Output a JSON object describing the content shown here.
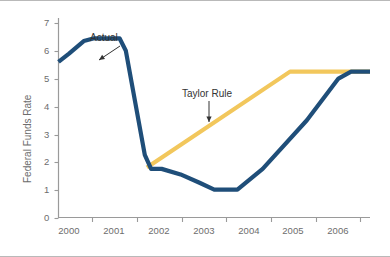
{
  "chart_data": {
    "type": "line",
    "title": "",
    "subtitle": "",
    "xlabel": "",
    "ylabel": "Federal Funds Rate",
    "xlim": [
      1999.5,
      2006.9
    ],
    "ylim": [
      0,
      7.4
    ],
    "grid": false,
    "legend_position": "inline-annotations",
    "ytick_labels": [
      "0",
      "1",
      "2",
      "3",
      "4",
      "5",
      "6",
      "7"
    ],
    "ytick_values": [
      0,
      1,
      2,
      3,
      4,
      5,
      6,
      7
    ],
    "xtick_labels": [
      "2000",
      "2001",
      "2002",
      "2003",
      "2004",
      "2005",
      "2006"
    ],
    "xtick_values": [
      2000,
      2001,
      2002,
      2003,
      2004,
      2005,
      2006
    ],
    "series": [
      {
        "name": "Actual",
        "color": "#1f4e79",
        "x": [
          1999.5,
          1999.75,
          2000.1,
          2000.35,
          2000.95,
          2001.1,
          2001.55,
          2001.7,
          2001.95,
          2002.4,
          2002.85,
          2003.2,
          2003.75,
          2004.35,
          2005.4,
          2006.15,
          2006.45,
          2006.9
        ],
        "y": [
          5.6,
          5.9,
          6.35,
          6.45,
          6.45,
          6.0,
          2.25,
          1.75,
          1.75,
          1.55,
          1.25,
          1.0,
          1.0,
          1.75,
          3.5,
          5.0,
          5.25,
          5.25
        ]
      },
      {
        "name": "Taylor Rule",
        "color": "#f2c75c",
        "x": [
          2001.6,
          2005.0,
          2006.9
        ],
        "y": [
          1.8,
          5.25,
          5.25
        ]
      }
    ],
    "annotations": [
      {
        "text": "Actual",
        "target_series": "Actual",
        "label_x": 90,
        "label_y": 32,
        "arrow_from": [
          120,
          46
        ],
        "arrow_to": [
          99,
          60
        ]
      },
      {
        "text": "Taylor Rule",
        "target_series": "Taylor Rule",
        "label_x": 182,
        "label_y": 88,
        "arrow_from": [
          209,
          101
        ],
        "arrow_to": [
          209,
          122
        ]
      }
    ]
  },
  "axes": {
    "y_axis_title": "Federal Funds Rate",
    "y_ticks": [
      {
        "label": "7",
        "px": 23
      },
      {
        "label": "6",
        "px": 51
      },
      {
        "label": "5",
        "px": 79
      },
      {
        "label": "4",
        "px": 107
      },
      {
        "label": "3",
        "px": 135
      },
      {
        "label": "2",
        "px": 162
      },
      {
        "label": "1",
        "px": 190
      },
      {
        "label": "0",
        "px": 218
      }
    ],
    "x_ticks": [
      {
        "label": "2000",
        "center_px": 69,
        "tick_px": 92
      },
      {
        "label": "2001",
        "center_px": 114,
        "tick_px": 137
      },
      {
        "label": "2002",
        "center_px": 159,
        "tick_px": 182
      },
      {
        "label": "2003",
        "center_px": 204,
        "tick_px": 226
      },
      {
        "label": "2004",
        "center_px": 249,
        "tick_px": 271
      },
      {
        "label": "2005",
        "center_px": 293,
        "tick_px": 316
      },
      {
        "label": "2006",
        "center_px": 338,
        "tick_px": 360
      }
    ]
  },
  "colors": {
    "actual_line": "#1f4e79",
    "taylor_line": "#f2c75c",
    "axis": "#9a9a9a",
    "tick_text": "#6d6d6d",
    "annotation_text": "#333333",
    "frame": "#b9b9b9",
    "background": "#ffffff"
  }
}
